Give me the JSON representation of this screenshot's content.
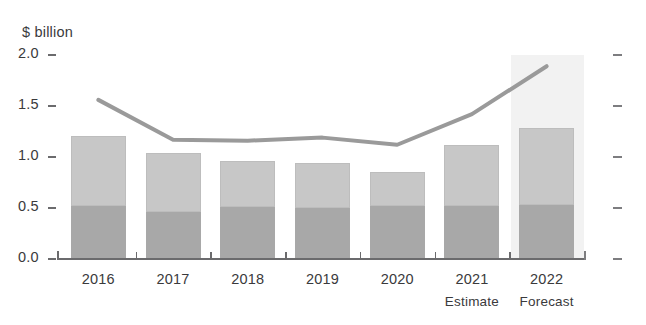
{
  "chart_data": {
    "type": "bar",
    "title": "",
    "subtitle": "",
    "xlabel": "",
    "ylabel": "$ billion",
    "ylim": [
      0.0,
      2.0
    ],
    "ytick_labels": [
      "0.0",
      "0.5",
      "1.0",
      "1.5",
      "2.0"
    ],
    "ytick_values": [
      0.0,
      0.5,
      1.0,
      1.5,
      2.0
    ],
    "grid": false,
    "legend": "none",
    "categories": [
      "2016",
      "2017",
      "2018",
      "2019",
      "2020",
      "2021",
      "2022"
    ],
    "category_sublabels": [
      "",
      "",
      "",
      "",
      "",
      "Estimate",
      "Forecast"
    ],
    "stacked": true,
    "series": [
      {
        "name": "lower-segment",
        "type": "bar",
        "color": "#a8a8a8",
        "values": [
          0.52,
          0.46,
          0.51,
          0.5,
          0.52,
          0.52,
          0.53
        ]
      },
      {
        "name": "upper-segment",
        "type": "bar",
        "color": "#c7c7c7",
        "values": [
          0.69,
          0.58,
          0.45,
          0.44,
          0.33,
          0.6,
          0.75
        ]
      },
      {
        "name": "line-series",
        "type": "line",
        "color": "#9a9a9a",
        "values": [
          1.56,
          1.17,
          1.16,
          1.19,
          1.12,
          1.42,
          1.89
        ]
      }
    ],
    "bar_totals": [
      1.21,
      1.04,
      0.96,
      0.94,
      0.85,
      1.12,
      1.28
    ],
    "highlight": {
      "category": "2022",
      "color": "#f2f2f2",
      "note": "shaded forecast column background"
    },
    "colors": {
      "bar_lower": "#a8a8a8",
      "bar_upper": "#c7c7c7",
      "line": "#9a9a9a",
      "axis": "#6b6b6d",
      "text": "#3a3a3c",
      "highlight_band": "#f2f2f2",
      "background": "#ffffff"
    }
  }
}
